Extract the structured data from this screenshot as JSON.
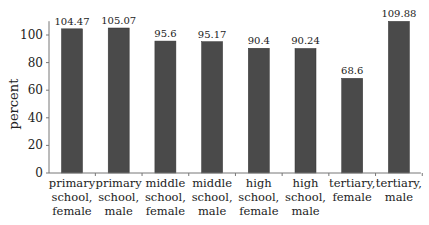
{
  "chart_data": {
    "type": "bar",
    "title": "",
    "xlabel": "",
    "ylabel": "percent",
    "ylim": [
      0,
      110
    ],
    "yticks": [
      0,
      20,
      40,
      60,
      80,
      100
    ],
    "grid": false,
    "legend": null,
    "bar_color": "#4a4a4a",
    "categories": [
      [
        "primary",
        "school,",
        "female"
      ],
      [
        "primary",
        "school,",
        "male"
      ],
      [
        "middle",
        "school,",
        "female"
      ],
      [
        "middle",
        "school,",
        "male"
      ],
      [
        "high",
        "school,",
        "female"
      ],
      [
        "high",
        "school,",
        "male"
      ],
      [
        "tertiary,",
        "female"
      ],
      [
        "tertiary,",
        "male"
      ]
    ],
    "values": [
      104.47,
      105.07,
      95.6,
      95.17,
      90.4,
      90.24,
      68.6,
      109.88
    ],
    "value_labels": [
      "104.47",
      "105.07",
      "95.6",
      "95.17",
      "90.4",
      "90.24",
      "68.6",
      "109.88"
    ]
  }
}
